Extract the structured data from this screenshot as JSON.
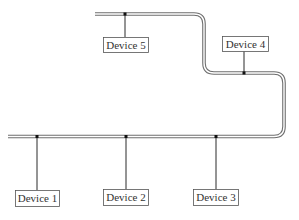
{
  "diagram": {
    "type": "bus-topology-network",
    "colors": {
      "bus_outer": "#6e6e6e",
      "bus_inner": "#ffffff",
      "drop_line": "#2a2a2a",
      "junction": "#111111",
      "box_border": "#555555",
      "label_text": "#333333"
    },
    "bus_path": "M 8 136.5 L 274 136.5 Q 284 136.5 284 126.5 L 284 83 Q 284 73 274 73 L 214 73 Q 204 73 204 63 L 204 24 Q 204 14 194 14 L 95 14",
    "devices": [
      {
        "label": "Device 1",
        "junction": {
          "x": 37,
          "y": 136.5
        },
        "drop_to_y": 190,
        "box": {
          "x": 15,
          "y": 190,
          "w": 44,
          "h": 16
        }
      },
      {
        "label": "Device 2",
        "junction": {
          "x": 126,
          "y": 136.5
        },
        "drop_to_y": 189,
        "box": {
          "x": 103,
          "y": 189,
          "w": 45,
          "h": 16
        }
      },
      {
        "label": "Device 3",
        "junction": {
          "x": 216,
          "y": 136.5
        },
        "drop_to_y": 189,
        "box": {
          "x": 193,
          "y": 189,
          "w": 45,
          "h": 16
        }
      },
      {
        "label": "Device 4",
        "junction": {
          "x": 244,
          "y": 73
        },
        "drop_to_y": 51,
        "box": {
          "x": 222,
          "y": 36,
          "w": 46,
          "h": 15
        }
      },
      {
        "label": "Device 5",
        "junction": {
          "x": 125,
          "y": 14
        },
        "drop_to_y": 37,
        "box": {
          "x": 103,
          "y": 37,
          "w": 45,
          "h": 15
        }
      }
    ]
  }
}
